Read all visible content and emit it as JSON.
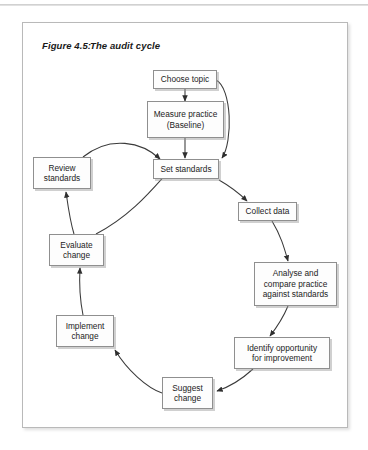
{
  "figure": {
    "number": "Figure 4.5:",
    "title": "The audit cycle"
  },
  "nodes": [
    {
      "id": "choose-topic",
      "label": "Choose topic"
    },
    {
      "id": "measure-practice",
      "label": "Measure practice\n(Baseline)"
    },
    {
      "id": "set-standards",
      "label": "Set standards"
    },
    {
      "id": "collect-data",
      "label": "Collect data"
    },
    {
      "id": "analyse-compare",
      "label": "Analyse and\ncompare practice\nagainst standards"
    },
    {
      "id": "identify-opportunity",
      "label": "Identify opportunity\nfor improvement"
    },
    {
      "id": "suggest-change",
      "label": "Suggest\nchange"
    },
    {
      "id": "implement-change",
      "label": "Implement\nchange"
    },
    {
      "id": "evaluate-change",
      "label": "Evaluate\nchange"
    },
    {
      "id": "review-standards",
      "label": "Review\nstandards"
    }
  ],
  "edges": [
    {
      "from": "choose-topic",
      "to": "measure-practice"
    },
    {
      "from": "choose-topic",
      "to": "set-standards"
    },
    {
      "from": "measure-practice",
      "to": "set-standards"
    },
    {
      "from": "set-standards",
      "to": "collect-data"
    },
    {
      "from": "collect-data",
      "to": "analyse-compare"
    },
    {
      "from": "analyse-compare",
      "to": "identify-opportunity"
    },
    {
      "from": "identify-opportunity",
      "to": "suggest-change"
    },
    {
      "from": "suggest-change",
      "to": "implement-change"
    },
    {
      "from": "implement-change",
      "to": "evaluate-change"
    },
    {
      "from": "evaluate-change",
      "to": "review-standards"
    },
    {
      "from": "evaluate-change",
      "to": "set-standards"
    },
    {
      "from": "review-standards",
      "to": "set-standards"
    }
  ],
  "colors": {
    "box_border": "#8f8f8f",
    "box_fill": "#fdfdfd",
    "arrow": "#3a3a3a",
    "frame_border": "#b9b9b9",
    "text": "#1c1c1c"
  }
}
